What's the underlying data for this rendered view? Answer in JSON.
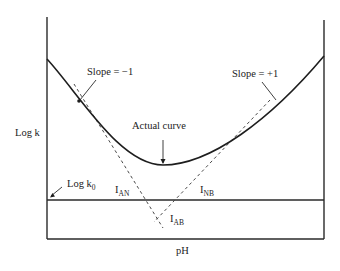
{
  "figure": {
    "y_axis_label": "Log k",
    "x_axis_label": "pH",
    "baseline_label": "Log k",
    "baseline_label_sub": "0",
    "annotations": {
      "slope_left": "Slope = −1",
      "slope_right": "Slope = +1",
      "actual_curve": "Actual curve",
      "i_an": "I",
      "i_an_sub": "AN",
      "i_nb": "I",
      "i_nb_sub": "NB",
      "i_ab": "I",
      "i_ab_sub": "AB"
    },
    "colors": {
      "line": "#1e1e1e",
      "dashed": "#4a4a4a",
      "background": "#ffffff"
    }
  }
}
